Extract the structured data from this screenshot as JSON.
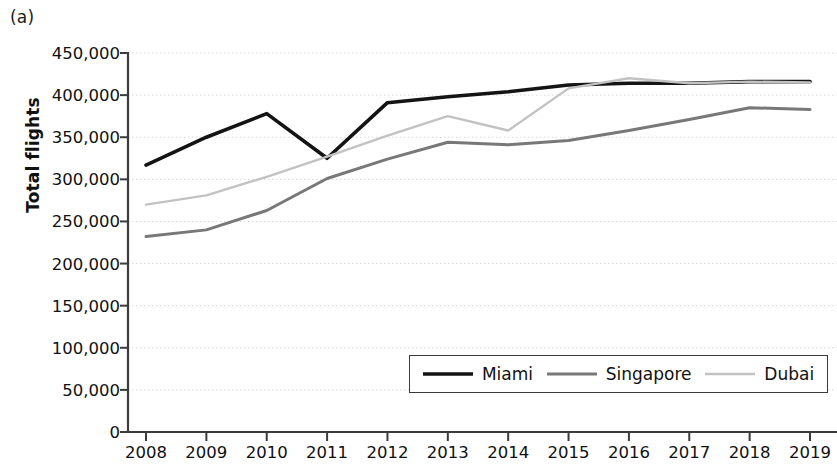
{
  "panel": {
    "label": "(a)"
  },
  "axes": {
    "y_title": "Total flights",
    "y_ticks": [
      "450,000",
      "400,000",
      "350,000",
      "300,000",
      "250,000",
      "200,000",
      "150,000",
      "100,000",
      "50,000",
      "0"
    ],
    "x_ticks": [
      "2008",
      "2009",
      "2010",
      "2011",
      "2012",
      "2013",
      "2014",
      "2015",
      "2016",
      "2017",
      "2018",
      "2019"
    ]
  },
  "legend": {
    "items": [
      {
        "label": "Miami",
        "color": "#141414",
        "width": 3.6
      },
      {
        "label": "Singapore",
        "color": "#787878",
        "width": 3.0
      },
      {
        "label": "Dubai",
        "color": "#c2c2c2",
        "width": 2.4
      }
    ]
  },
  "chart_data": {
    "type": "line",
    "title": "",
    "xlabel": "",
    "ylabel": "Total flights",
    "x": [
      2008,
      2009,
      2010,
      2011,
      2012,
      2013,
      2014,
      2015,
      2016,
      2017,
      2018,
      2019
    ],
    "categories": [
      "2008",
      "2009",
      "2010",
      "2011",
      "2012",
      "2013",
      "2014",
      "2015",
      "2016",
      "2017",
      "2018",
      "2019"
    ],
    "ylim": [
      0,
      450000
    ],
    "ytick_interval": 50000,
    "grid": true,
    "grid_axis": "y",
    "legend_position": "bottom-right-inside",
    "series": [
      {
        "name": "Miami",
        "color": "#141414",
        "line_width": 3.6,
        "values": [
          317000,
          350000,
          378000,
          325000,
          391000,
          398000,
          404000,
          412000,
          414000,
          414000,
          416000,
          416000
        ]
      },
      {
        "name": "Singapore",
        "color": "#787878",
        "line_width": 3.0,
        "values": [
          232000,
          240000,
          263000,
          301000,
          324000,
          344000,
          341000,
          346000,
          358000,
          371000,
          385000,
          383000
        ]
      },
      {
        "name": "Dubai",
        "color": "#c2c2c2",
        "line_width": 2.4,
        "values": [
          270000,
          281000,
          303000,
          327000,
          352000,
          375000,
          358000,
          408000,
          420000,
          414000,
          416000,
          415000
        ]
      }
    ]
  }
}
